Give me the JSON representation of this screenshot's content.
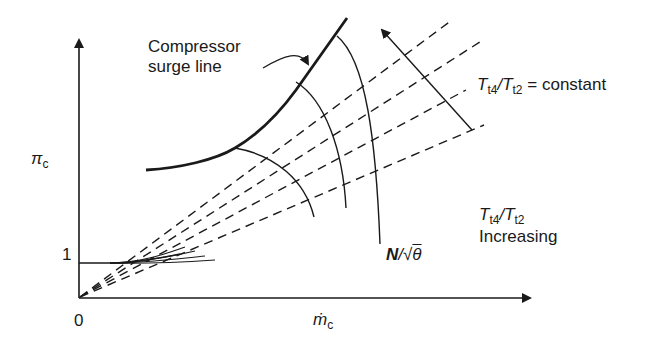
{
  "figure": {
    "type": "compressor-map",
    "axes": {
      "x_label_symbol": "ṁ",
      "x_label_sub": "c",
      "y_label_symbol": "π",
      "y_label_sub": "c",
      "origin_label": "0",
      "y_tick_label": "1"
    },
    "annotations": {
      "surge_line_line1": "Compressor",
      "surge_line_line2": "surge line",
      "constant_T": "T",
      "constant_T_sub1": "t4",
      "constant_slash": "/",
      "constant_T2": "T",
      "constant_T_sub2": "t2",
      "constant_suffix": " = constant",
      "increasing_T": "T",
      "increasing_sub1": "t4",
      "increasing_slash": "/",
      "increasing_T2": "T",
      "increasing_sub2": "t2",
      "increasing_word": "Increasing",
      "speed_N": "N",
      "speed_slash": "/",
      "speed_sqrt": "√",
      "speed_theta": "θ"
    },
    "elements": {
      "surge_line": "solid thick curve",
      "speed_lines_count": 3,
      "constant_temperature_ratio_lines_count": 4
    }
  }
}
